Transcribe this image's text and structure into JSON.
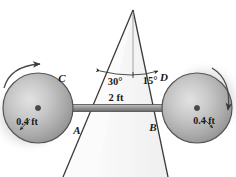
{
  "figure": {
    "background_color": "#ffffff",
    "width": 236,
    "height": 177
  },
  "labels": {
    "point_c": "C",
    "point_a": "A",
    "point_d": "D",
    "point_b": "B",
    "angle_left": "30°",
    "angle_right": "15°",
    "bar_length": "2 ft",
    "radius_left": "0.4 ft",
    "radius_right": "0.4 ft"
  },
  "geometry": {
    "apex": {
      "x": 133,
      "y": 10
    },
    "left_wheel": {
      "cx": 38,
      "cy": 108,
      "r": 35
    },
    "right_wheel": {
      "cx": 197,
      "cy": 108,
      "r": 35
    },
    "bar": {
      "x1": 38,
      "y1": 108,
      "x2": 197,
      "y2": 108
    },
    "left_wedge_line": {
      "x1": 133,
      "y1": 10,
      "x2": 63,
      "y2": 177
    },
    "right_wedge_line": {
      "x1": 133,
      "y1": 10,
      "x2": 168,
      "y2": 177
    },
    "vertical_reference": {
      "x1": 133,
      "y1": 10,
      "x2": 133,
      "y2": 75
    },
    "angle_arc_radius": 65
  },
  "colors": {
    "wheel_light": "#d8d8d8",
    "wheel_mid": "#b4b4b4",
    "wheel_dark": "#8a8a8a",
    "wheel_edge": "#5a5a5a",
    "bar_light": "#b8b8b8",
    "bar_dark": "#6e6e6e",
    "line_stroke": "#2b2b2b",
    "wedge_fill": "#f2f2f2",
    "shadow": "#c9c9c9",
    "text": "#1a1a1a"
  },
  "annotations": {
    "left_rotation_arrow": "counterclockwise-rotation-arrow",
    "right_rotation_arrow": "clockwise-rotation-arrow",
    "radius_arrow_left": "radius-indicator-arrow",
    "radius_arrow_right": "radius-indicator-arrow"
  }
}
